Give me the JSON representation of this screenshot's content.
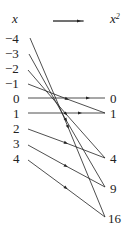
{
  "header": {
    "domain_label": "x",
    "arrow": "→",
    "codomain_label": "x",
    "codomain_exp": "2"
  },
  "domain": [
    "−4",
    "−3",
    "−2",
    "−1",
    "0",
    "1",
    "2",
    "3",
    "4"
  ],
  "codomain": [
    "0",
    "1",
    "4",
    "9",
    "16"
  ],
  "mapping": [
    {
      "from": "−4",
      "to": "16"
    },
    {
      "from": "−3",
      "to": "9"
    },
    {
      "from": "−2",
      "to": "4"
    },
    {
      "from": "−1",
      "to": "1"
    },
    {
      "from": "0",
      "to": "0"
    },
    {
      "from": "1",
      "to": "1"
    },
    {
      "from": "2",
      "to": "4"
    },
    {
      "from": "3",
      "to": "9"
    },
    {
      "from": "4",
      "to": "16"
    }
  ],
  "colors": {
    "line": "#222222",
    "text": "#222222"
  }
}
